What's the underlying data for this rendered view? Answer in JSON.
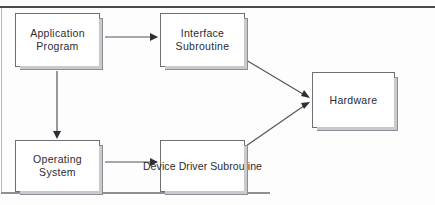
{
  "diagram": {
    "type": "block-diagram",
    "frame": {
      "top_rule_color": "#4a4a52",
      "left_rule_color": "#b9b9bd",
      "bottom_rule_color": "#8e8e95"
    },
    "nodes": [
      {
        "id": "application",
        "label": "Application\nProgram",
        "x": 15,
        "y": 13,
        "w": 85,
        "h": 54
      },
      {
        "id": "interface",
        "label": "Interface\nSubroutine",
        "x": 160,
        "y": 13,
        "w": 85,
        "h": 54
      },
      {
        "id": "hardware",
        "label": "Hardware",
        "x": 312,
        "y": 72,
        "w": 83,
        "h": 56
      },
      {
        "id": "os",
        "label": "Operating\nSystem",
        "x": 15,
        "y": 140,
        "w": 85,
        "h": 52
      },
      {
        "id": "devicedriver",
        "label": "Device Driver\nSubroutine",
        "x": 160,
        "y": 140,
        "w": 85,
        "h": 52
      }
    ],
    "edges": [
      {
        "id": "application-to-interface",
        "from": "application",
        "to": "interface",
        "direction": "right"
      },
      {
        "id": "application-to-os",
        "from": "application",
        "to": "os",
        "direction": "down"
      },
      {
        "id": "os-to-devicedriver",
        "from": "os",
        "to": "devicedriver",
        "direction": "right"
      },
      {
        "id": "interface-to-hardware",
        "from": "interface",
        "to": "hardware",
        "direction": "diagonal-down-right"
      },
      {
        "id": "devicedriver-to-hardware",
        "from": "devicedriver",
        "to": "hardware",
        "direction": "diagonal-up-right"
      }
    ],
    "colors": {
      "node_border": "#6f6f76",
      "node_fill": "#ffffff",
      "node_shadow": "#c9c9ce",
      "connector": "#55555d",
      "arrowhead": "#2e2e34",
      "text": "#2b2b31",
      "background": "#fdfdfd"
    }
  }
}
